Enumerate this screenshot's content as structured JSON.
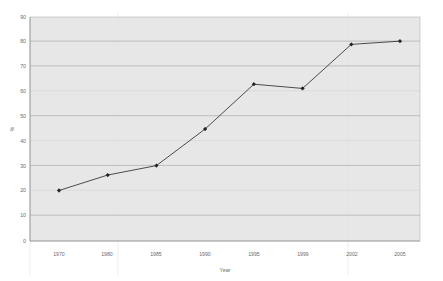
{
  "chart_data": {
    "type": "line",
    "title": "",
    "xlabel": "Year",
    "ylabel": "%",
    "categories": [
      "1970",
      "1980",
      "1985",
      "1990",
      "1995",
      "1999",
      "2002",
      "2005"
    ],
    "values": [
      20.3,
      26.5,
      30.3,
      45.0,
      63.0,
      61.3,
      79.0,
      80.3
    ],
    "series": [
      {
        "name": "",
        "values": [
          20.3,
          26.5,
          30.3,
          45.0,
          63.0,
          61.3,
          79.0,
          80.3
        ]
      }
    ],
    "ylim": [
      0,
      90
    ],
    "yticks": [
      0,
      10,
      20,
      30,
      40,
      50,
      60,
      70,
      80,
      90
    ],
    "ytick_labels": [
      "0",
      "10",
      "20",
      "30",
      "40",
      "50",
      "60",
      "70",
      "80",
      "90"
    ],
    "xtick_labels": [
      "1970",
      "1980",
      "1985",
      "1990",
      "1995",
      "1999",
      "2002",
      "2005"
    ],
    "grid": true,
    "grid_axis": "y",
    "legend": false,
    "legend_position": "none",
    "marker": "diamond",
    "line_color": "#3a3a3a",
    "marker_color": "#222222",
    "plot_background": "#e7e7e7",
    "page_background": "#ffffff",
    "gridline_color": "#9a9a9a",
    "annotations": []
  },
  "axes": {
    "y_title": "%",
    "x_title": "Year"
  }
}
